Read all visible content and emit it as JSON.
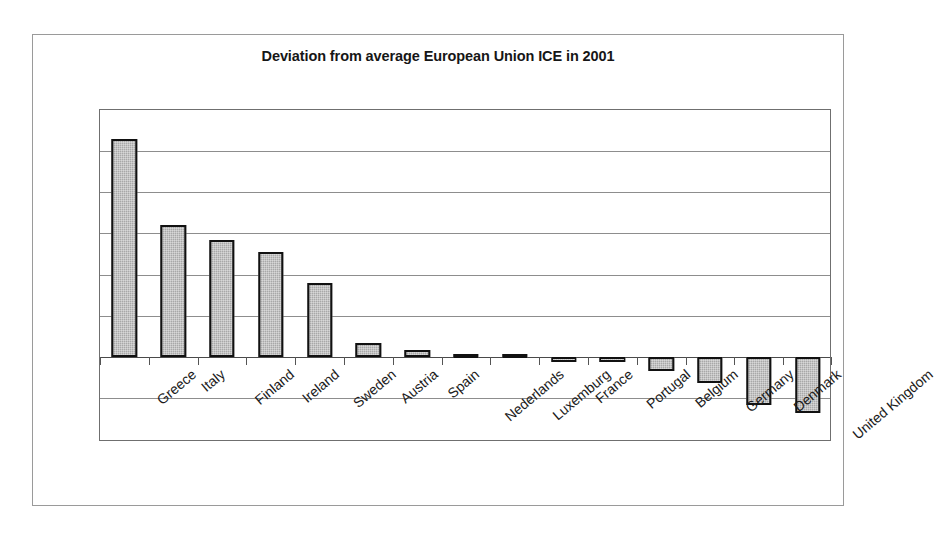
{
  "figure": {
    "title": "Deviation from average European Union ICE in 2001",
    "background_color": "#ffffff",
    "frame_color": "#9a9a9a",
    "bar_fill_color": "#a8a8a8",
    "bar_border_color": "#111111",
    "gridline_color": "#8d8d8d",
    "axis_color": "#4a4a4a"
  },
  "chart_data": {
    "type": "bar",
    "title": "Deviation from average European Union ICE in 2001",
    "xlabel": "",
    "ylabel": "",
    "orientation": "vertical",
    "grid": true,
    "gridlines_horizontal": 8,
    "legend": false,
    "legend_position": "none",
    "y_axis_tick_labels": false,
    "zero_line": true,
    "sorted": "descending",
    "categories": [
      "Greece",
      "Italy",
      "Finland",
      "Ireland",
      "Sweden",
      "Austria",
      "Spain",
      "Nederlands",
      "Luxemburg",
      "France",
      "Portugal",
      "Belgium",
      "Germany",
      "Denmark",
      "United Kingdom"
    ],
    "values": [
      5.3,
      3.2,
      2.85,
      2.55,
      1.8,
      0.35,
      0.17,
      0.07,
      0.0,
      -0.12,
      -0.12,
      -0.35,
      -0.63,
      -1.17,
      -1.37
    ],
    "ylim": [
      -1.8,
      6.3
    ],
    "units": "relative deviation (unlabelled axis)"
  },
  "labels": {
    "cat_0": "Greece",
    "cat_1": "Italy",
    "cat_2": "Finland",
    "cat_3": "Ireland",
    "cat_4": "Sweden",
    "cat_5": "Austria",
    "cat_6": "Spain",
    "cat_7": "Nederlands",
    "cat_8": "Luxemburg",
    "cat_9": "France",
    "cat_10": "Portugal",
    "cat_11": "Belgium",
    "cat_12": "Germany",
    "cat_13": "Denmark",
    "cat_14": "United Kingdom"
  }
}
